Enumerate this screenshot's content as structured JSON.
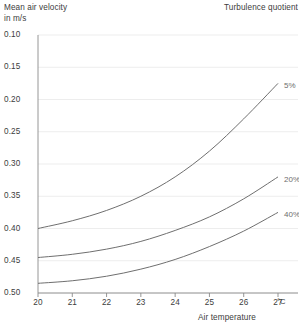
{
  "header": {
    "y_axis_caption_line1": "Mean air velocity",
    "y_axis_caption_line2": "in m/s",
    "legend_caption": "Turbulence quotient"
  },
  "axes": {
    "x_title": "Air temperature",
    "x_unit": "°C",
    "y_ticks": [
      "0.50",
      "0.45",
      "0.40",
      "0.35",
      "0.30",
      "0.25",
      "0.20",
      "0.15",
      "0.10"
    ],
    "x_ticks": [
      "20",
      "21",
      "22",
      "23",
      "24",
      "25",
      "26",
      "27"
    ]
  },
  "colors": {
    "curve": "#6f6f6f",
    "grid": "#ededed",
    "axis": "#8a8a8a",
    "text": "#3c3c3c",
    "label": "#6e6e6e"
  },
  "chart_data": {
    "type": "line",
    "title": "",
    "subtitle": "",
    "xlabel": "Air temperature",
    "ylabel": "Mean air velocity in m/s",
    "xunit": "°C",
    "yunit": "m/s",
    "xlim": [
      20,
      27
    ],
    "ylim": [
      0.1,
      0.5
    ],
    "xticks": [
      20,
      21,
      22,
      23,
      24,
      25,
      26,
      27
    ],
    "yticks": [
      0.1,
      0.15,
      0.2,
      0.25,
      0.3,
      0.35,
      0.4,
      0.45,
      0.5
    ],
    "grid": true,
    "legend": "inline-right",
    "legend_title": "Turbulence quotient",
    "x": [
      20,
      21,
      22,
      23,
      24,
      25,
      26,
      27
    ],
    "series": [
      {
        "name": "5%",
        "label": "5%",
        "values": [
          0.2,
          0.212,
          0.228,
          0.25,
          0.28,
          0.32,
          0.37,
          0.425
        ]
      },
      {
        "name": "20%",
        "label": "20%",
        "values": [
          0.155,
          0.16,
          0.168,
          0.18,
          0.197,
          0.218,
          0.246,
          0.28
        ]
      },
      {
        "name": "40%",
        "label": "40%",
        "values": [
          0.115,
          0.119,
          0.126,
          0.137,
          0.152,
          0.172,
          0.196,
          0.225
        ]
      }
    ]
  }
}
